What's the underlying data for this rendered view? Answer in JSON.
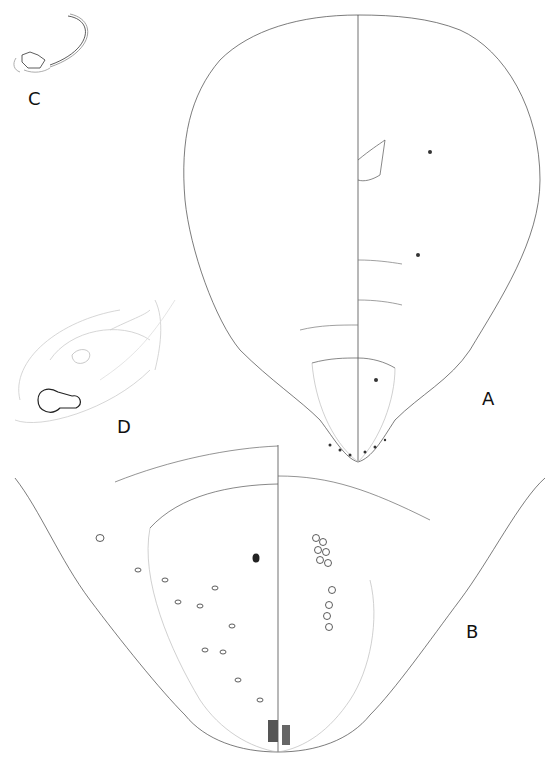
{
  "figure": {
    "type": "scientific illustration plate",
    "panels": [
      {
        "id": "A",
        "label": "A",
        "content": "whole body outline, dorsal/ventral halves"
      },
      {
        "id": "B",
        "label": "B",
        "content": "enlarged posterior abdomen detail"
      },
      {
        "id": "C",
        "label": "C",
        "content": "leg / appendage detail with long seta"
      },
      {
        "id": "D",
        "label": "D",
        "content": "pore / tubular duct detail"
      }
    ]
  },
  "colors": {
    "ink": "#222222",
    "faint": "#bbbbbb",
    "background": "#ffffff"
  }
}
